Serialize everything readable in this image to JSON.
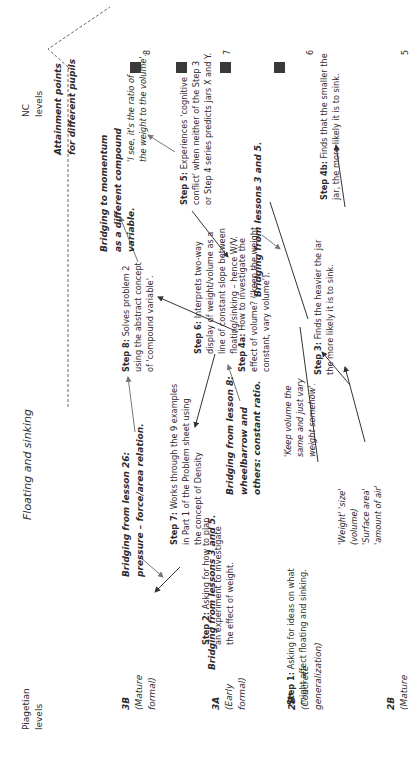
{
  "title": "Floating and sinking",
  "axes": {
    "left_heading": [
      "Piagetian",
      "levels"
    ],
    "right_heading": [
      "NC",
      "levels"
    ],
    "attainment_label": [
      "Attainment points",
      "for different pupils"
    ]
  },
  "piagetian_levels": [
    {
      "code": "3B",
      "lines": [
        "(Mature",
        "formal)"
      ]
    },
    {
      "code": "3A",
      "lines": [
        "(Early",
        "formal)"
      ]
    },
    {
      "code": "2B*",
      "lines": [
        "(Concrete",
        "generalization)"
      ]
    },
    {
      "code": "2B",
      "lines": [
        "(Mature"
      ]
    }
  ],
  "nc_levels": [
    "8",
    "7",
    "6",
    "5"
  ],
  "steps": {
    "step1": {
      "label": "Step 1:",
      "lines": [
        " Asking for ideas on what",
        "might affect floating and sinking."
      ]
    },
    "step2": {
      "label": "Step 2:",
      "lines": [
        " Asking for how to plan",
        "an experiment to investigate",
        "the effect of weight."
      ]
    },
    "step3": {
      "label": "Step 3:",
      "lines": [
        " Finds the heavier the jar",
        "the more likely it is to sink."
      ]
    },
    "step4a": {
      "label": "Step 4a:",
      "lines": [
        " How to investigate the",
        "effect of volume? ('keep the weight",
        "constant, vary volume')."
      ]
    },
    "step4b": {
      "label": "Step 4b:",
      "lines": [
        " Finds that the smaller the",
        "jar, the more likely it is to sink."
      ]
    },
    "step5": {
      "label": "Step 5:",
      "lines": [
        " Experiences 'cognitive",
        "conflict' when neither of the Step 3",
        "or Step 4 series predicts jars X and Y."
      ]
    },
    "step6": {
      "label": "Step 6:",
      "lines": [
        " Interprets two-way",
        "display of weight/volume as a",
        "line of constant slope between",
        "floating/sinking – hence W/V."
      ]
    },
    "step7": {
      "label": "Step 7:",
      "lines": [
        " Works through the 9 examples",
        "in Part 1 of the Problem sheet using",
        "the concept of Density"
      ]
    },
    "step8": {
      "label": "Step 8:",
      "lines": [
        " Solves problem 2",
        "using the abstract concept",
        "of 'compound variable'."
      ]
    }
  },
  "bridges": {
    "lesson26": [
      "Bridging from lesson 26:",
      "pressure – force/area relation."
    ],
    "lessons35_left": [
      "Bridging from lessons 3 and 5."
    ],
    "lesson8": [
      "Bridging from lesson 8:",
      "wheelbarrow and",
      "others: constant ratio."
    ],
    "momentum": [
      "Bridging to momentum",
      "as a different compound",
      "variable."
    ],
    "lessons35_right": [
      "Bridging from lessons 3 and 5."
    ]
  },
  "quotes": {
    "ratio": [
      "'I see, it's the ratio of",
      "the weight to the volume'."
    ],
    "keep_volume": [
      "'Keep volume the",
      "same and just vary",
      "weight somehow'."
    ],
    "ideas": [
      "'Weight' 'size'",
      "(volume)",
      "'Surface area'",
      "'amount of air'"
    ]
  },
  "colors": {
    "square": "#3a3a3a",
    "text": "#2b2b2b",
    "arrow": "#333333"
  }
}
